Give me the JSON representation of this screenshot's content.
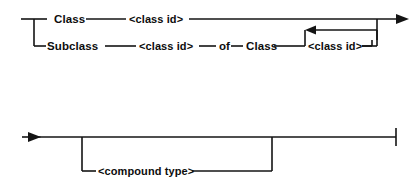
{
  "diagram": {
    "type": "railroad-syntax-diagram",
    "title": "",
    "ink_color": "#141414",
    "background_color": "#ffffff",
    "rows": [
      {
        "id": "row-class",
        "label": "Class branch",
        "tokens": [
          {
            "name": "keyword-class",
            "text": "Class",
            "kind": "keyword"
          },
          {
            "name": "nonterminal-class-id",
            "text": "<class id>",
            "kind": "nonterminal"
          }
        ]
      },
      {
        "id": "row-subclass",
        "label": "Subclass branch",
        "tokens": [
          {
            "name": "keyword-subclass",
            "text": "Subclass",
            "kind": "keyword"
          },
          {
            "name": "nonterminal-class-id-2",
            "text": "<class id>",
            "kind": "nonterminal"
          },
          {
            "name": "keyword-of",
            "text": "of",
            "kind": "keyword"
          },
          {
            "name": "keyword-class-2",
            "text": "Class",
            "kind": "keyword"
          },
          {
            "name": "nonterminal-class-id-3",
            "text": "<class id>",
            "kind": "nonterminal"
          }
        ]
      },
      {
        "id": "row-compound",
        "label": "Compound type branch",
        "tokens": [
          {
            "name": "nonterminal-compound-type",
            "text": "<compound type>",
            "kind": "nonterminal"
          }
        ]
      }
    ],
    "labels": {
      "class": "Class",
      "class_id_1": "<class id>",
      "subclass": "Subclass",
      "class_id_2": "<class id>",
      "of": "of",
      "class_2": "Class",
      "class_id_3": "<class id>",
      "compound_type": "<compound type>"
    },
    "markers": {
      "entry_arrow": "arrowhead-right",
      "exit_arrow": "arrowhead-right",
      "loop_arrow": "arrowhead-left",
      "terminator": "vertical-bar"
    }
  }
}
